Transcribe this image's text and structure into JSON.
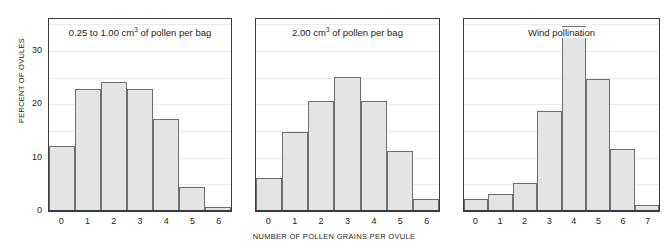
{
  "chart_data": {
    "type": "bar",
    "title": "",
    "xlabel": "NUMBER OF POLLEN GRAINS PER OVULE",
    "ylabel": "PERCENT OF OVULES",
    "ylim": [
      0,
      36
    ],
    "yticks": [
      0,
      10,
      20,
      30
    ],
    "ytick_labels": [
      "0",
      "10",
      "20",
      "30"
    ],
    "gridlines": [
      5,
      10,
      15,
      20,
      25,
      30,
      35
    ],
    "grid": true,
    "legend": "none",
    "bar_fill": "#e4e4e4",
    "bar_edge": "#6d6e71",
    "axis_color": "#3b3b3b",
    "grid_color": "#ebebeb",
    "panels": [
      {
        "title_parts": {
          "pre": "0.25 to 1.00 cm",
          "sup": "3",
          "post": " of pollen per bag"
        },
        "title_plain": "0.25 to 1.00 cm3 of pollen per bag",
        "categories": [
          "0",
          "1",
          "2",
          "3",
          "4",
          "5",
          "6"
        ],
        "values": [
          12,
          22.7,
          24,
          22.7,
          17,
          4.3,
          0.5
        ]
      },
      {
        "title_parts": {
          "pre": "2.00 cm",
          "sup": "3",
          "post": " of pollen per bag"
        },
        "title_plain": "2.00 cm3 of pollen per bag",
        "categories": [
          "0",
          "1",
          "2",
          "3",
          "4",
          "5",
          "6"
        ],
        "values": [
          6,
          14.6,
          20.5,
          25,
          20.5,
          11,
          2
        ]
      },
      {
        "title_parts": {
          "pre": "Wind pollination",
          "sup": "",
          "post": ""
        },
        "title_plain": "Wind pollination",
        "categories": [
          "0",
          "1",
          "2",
          "3",
          "4",
          "5",
          "6",
          "7"
        ],
        "values": [
          2,
          3,
          5,
          18.5,
          34.5,
          24.5,
          11.5,
          1
        ]
      }
    ]
  }
}
